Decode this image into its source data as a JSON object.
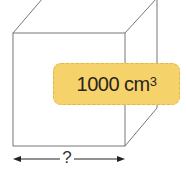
{
  "diagram": {
    "type": "cube",
    "volume_label": {
      "value": "1000",
      "unit": "cm",
      "exponent": "3",
      "background_color": "#f5d36a"
    },
    "edge_label": "?",
    "line_color": "#777777"
  }
}
